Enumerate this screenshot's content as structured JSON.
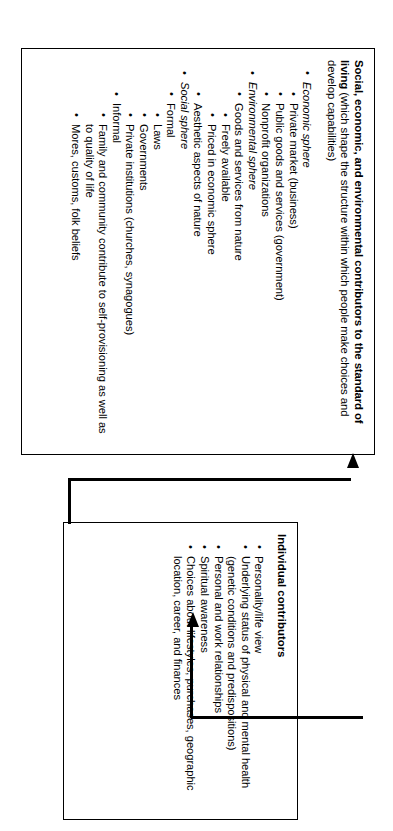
{
  "diagram": {
    "type": "flow-diagram",
    "orientation": "page-rotated-90-clockwise",
    "top_box": {
      "title_bold": "Social, economic, and environmental contributors to the standard of living",
      "title_regular": " (which shape the structure within which people make choices and develop capabilities)",
      "groups": [
        {
          "heading": "Economic sphere",
          "heading_style": "italic",
          "items": [
            "Private market (business)",
            "Public goods and services (government)",
            "Nonprofit organizations"
          ]
        },
        {
          "heading": "Environmental sphere",
          "heading_style": "italic",
          "items": [
            {
              "text": "Goods and services from nature",
              "subitems": [
                "Freely available",
                "Priced in economic sphere"
              ]
            },
            {
              "text": "Aesthetic aspects of nature",
              "subitems": []
            }
          ]
        },
        {
          "heading": "Social sphere",
          "heading_style": "italic",
          "items": [
            {
              "text": "Formal",
              "subitems": [
                "Laws",
                "Governments",
                "Private institutions (churches, synagogues)"
              ]
            },
            {
              "text": "Informal",
              "subitems": [
                "Family and community contribute to self-provisioning as well as to quality of life",
                "Mores, customs, folk beliefs"
              ]
            }
          ]
        }
      ]
    },
    "bottom_box": {
      "title": "Individual contributors",
      "items": [
        "Personality/life view",
        "Underlying status of physical and mental health (genetic conditions and predispositions)",
        "Personal and work relationships",
        "Spiritual awareness",
        "Choices about lifestyles, purchases, geographic location, career, and finances"
      ]
    },
    "connectors": [
      {
        "name": "individual-to-context-arrow",
        "direction": "upward"
      },
      {
        "name": "context-to-individual-arrow",
        "direction": "downward"
      }
    ],
    "colors": {
      "stroke": "#000000",
      "background": "#ffffff",
      "text": "#000000"
    }
  }
}
